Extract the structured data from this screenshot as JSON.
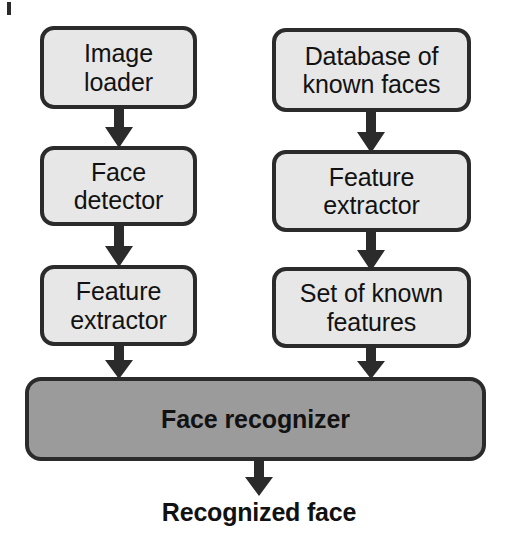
{
  "diagram": {
    "colors": {
      "box_fill_light": "#e7e7e7",
      "box_fill_dark": "#9b9b9b",
      "stroke": "#2b2b2b",
      "text": "#121212",
      "background": "#ffffff"
    },
    "nodes": [
      {
        "id": "image-loader",
        "label": "Image\nloader",
        "column": "left",
        "row": 1,
        "style": "light"
      },
      {
        "id": "database-of-known-faces",
        "label": "Database of\nknown faces",
        "column": "right",
        "row": 1,
        "style": "light"
      },
      {
        "id": "face-detector",
        "label": "Face\ndetector",
        "column": "left",
        "row": 2,
        "style": "light"
      },
      {
        "id": "feature-extractor-right",
        "label": "Feature\nextractor",
        "column": "right",
        "row": 2,
        "style": "light"
      },
      {
        "id": "feature-extractor-left",
        "label": "Feature\nextractor",
        "column": "left",
        "row": 3,
        "style": "light"
      },
      {
        "id": "set-of-known-features",
        "label": "Set of known\nfeatures",
        "column": "right",
        "row": 3,
        "style": "light"
      },
      {
        "id": "face-recognizer",
        "label": "Face recognizer",
        "column": "full",
        "row": 4,
        "style": "dark"
      }
    ],
    "output_label": "Recognized face",
    "edges": [
      {
        "from": "image-loader",
        "to": "face-detector"
      },
      {
        "from": "face-detector",
        "to": "feature-extractor-left"
      },
      {
        "from": "feature-extractor-left",
        "to": "face-recognizer"
      },
      {
        "from": "database-of-known-faces",
        "to": "feature-extractor-right"
      },
      {
        "from": "feature-extractor-right",
        "to": "set-of-known-features"
      },
      {
        "from": "set-of-known-features",
        "to": "face-recognizer"
      },
      {
        "from": "face-recognizer",
        "to": "output-label"
      }
    ]
  }
}
